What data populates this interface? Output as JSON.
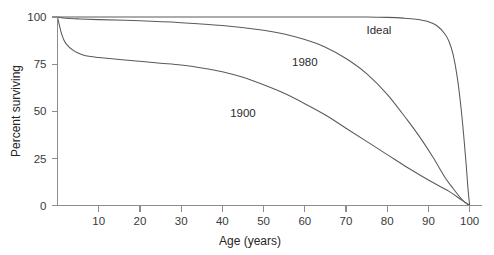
{
  "chart_data": {
    "type": "line",
    "title": "",
    "xlabel": "Age (years)",
    "ylabel": "Percent surviving",
    "xlim": [
      0,
      103
    ],
    "ylim": [
      0,
      100
    ],
    "grid": false,
    "legend_position": "inline-curve-labels",
    "xticks": [
      10,
      20,
      30,
      40,
      50,
      60,
      70,
      80,
      90,
      100
    ],
    "xtick_labels": [
      "10",
      "20",
      "30",
      "40",
      "50",
      "60",
      "70",
      "80",
      "90",
      "100"
    ],
    "yticks": [
      0,
      25,
      50,
      75,
      100
    ],
    "ytick_labels": [
      "0",
      "25",
      "50",
      "75",
      "100"
    ],
    "line_color": "#5a5a5a",
    "axis_color": "#8d8d8d",
    "background_color": "#ffffff",
    "series": [
      {
        "name": "Ideal",
        "label": "Ideal",
        "label_x": 78,
        "label_y": 93,
        "x": [
          0,
          5,
          10,
          20,
          30,
          40,
          50,
          60,
          70,
          75,
          80,
          84,
          87,
          90,
          92,
          94,
          95,
          96,
          97,
          98,
          99,
          99.6,
          100
        ],
        "y": [
          100,
          100,
          100,
          100,
          100,
          100,
          100,
          100,
          100,
          100,
          99.8,
          99.4,
          98.8,
          97.5,
          95.5,
          91,
          87,
          80,
          68,
          50,
          26,
          9,
          0
        ]
      },
      {
        "name": "1980",
        "label": "1980",
        "label_x": 60,
        "label_y": 76,
        "x": [
          0,
          2,
          5,
          10,
          20,
          30,
          40,
          50,
          55,
          60,
          65,
          70,
          75,
          80,
          85,
          88,
          91,
          94,
          96,
          98,
          99,
          100
        ],
        "y": [
          100,
          99.3,
          99,
          98.6,
          98,
          97,
          95.5,
          93,
          91,
          88,
          84,
          78,
          70,
          59,
          45,
          36,
          26,
          15,
          9,
          3.5,
          1.5,
          0
        ]
      },
      {
        "name": "1900",
        "label": "1900",
        "label_x": 45,
        "label_y": 49,
        "x": [
          0,
          1,
          2,
          4,
          6,
          8,
          10,
          15,
          20,
          25,
          30,
          35,
          40,
          45,
          50,
          55,
          60,
          65,
          70,
          75,
          80,
          85,
          90,
          95,
          98,
          100
        ],
        "y": [
          100,
          91,
          86,
          82,
          80,
          79,
          78.5,
          77.5,
          76.5,
          75.5,
          74.5,
          73,
          71,
          68,
          64,
          59.5,
          54,
          48,
          41,
          34,
          27,
          20,
          13.5,
          7.5,
          3,
          0
        ]
      }
    ]
  }
}
